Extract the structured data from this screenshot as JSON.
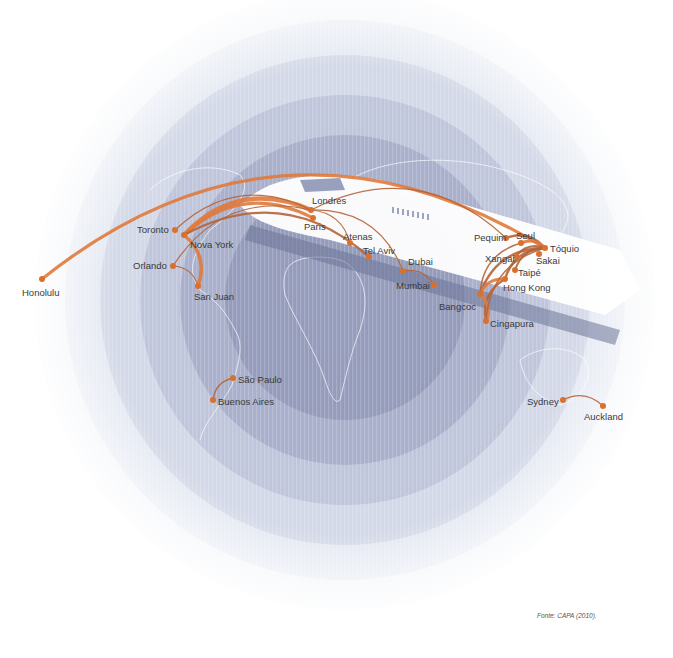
{
  "source_note": "Fonte: CAPA (2010).",
  "colors": {
    "route": "#e07a3c",
    "route_dark": "#b4643a",
    "node": "#d9702e",
    "ring_light": "#e6eaf3",
    "ring_dark": "#8a92b2",
    "plane_body": "#ffffff"
  },
  "cities": [
    {
      "id": "honolulu",
      "label": "Honolulu",
      "x": 42,
      "y": 279,
      "lx": 22,
      "ly": 296
    },
    {
      "id": "toronto",
      "label": "Toronto",
      "x": 175,
      "y": 230,
      "lx": 137,
      "ly": 233
    },
    {
      "id": "nova-york",
      "label": "Nova York",
      "x": 184,
      "y": 235,
      "lx": 190,
      "ly": 248
    },
    {
      "id": "orlando",
      "label": "Orlando",
      "x": 173,
      "y": 266,
      "lx": 133,
      "ly": 269
    },
    {
      "id": "san-juan",
      "label": "San Juan",
      "x": 198,
      "y": 286,
      "lx": 194,
      "ly": 300
    },
    {
      "id": "londres",
      "label": "Londres",
      "x": 311,
      "y": 210,
      "lx": 312,
      "ly": 204
    },
    {
      "id": "paris",
      "label": "Paris",
      "x": 313,
      "y": 218,
      "lx": 304,
      "ly": 230
    },
    {
      "id": "atenas",
      "label": "Atenas",
      "x": 350,
      "y": 243,
      "lx": 343,
      "ly": 240
    },
    {
      "id": "tel-aviv",
      "label": "Tel Aviv",
      "x": 369,
      "y": 257,
      "lx": 363,
      "ly": 254
    },
    {
      "id": "dubai",
      "label": "Dubai",
      "x": 403,
      "y": 271,
      "lx": 408,
      "ly": 265
    },
    {
      "id": "mumbai",
      "label": "Mumbai",
      "x": 434,
      "y": 285,
      "lx": 396,
      "ly": 289
    },
    {
      "id": "pequim",
      "label": "Pequim",
      "x": 506,
      "y": 238,
      "lx": 474,
      "ly": 241
    },
    {
      "id": "seul",
      "label": "Seul",
      "x": 521,
      "y": 243,
      "lx": 516,
      "ly": 239
    },
    {
      "id": "toquio",
      "label": "Tóquio",
      "x": 545,
      "y": 248,
      "lx": 550,
      "ly": 252
    },
    {
      "id": "xangai",
      "label": "Xangai",
      "x": 516,
      "y": 256,
      "lx": 485,
      "ly": 262
    },
    {
      "id": "sakai",
      "label": "Sakai",
      "x": 539,
      "y": 254,
      "lx": 536,
      "ly": 264
    },
    {
      "id": "taipe",
      "label": "Taipé",
      "x": 515,
      "y": 270,
      "lx": 518,
      "ly": 276
    },
    {
      "id": "hong-kong",
      "label": "Hong Kong",
      "x": 505,
      "y": 279,
      "lx": 503,
      "ly": 291
    },
    {
      "id": "bangcoc",
      "label": "Bangcoc",
      "x": 480,
      "y": 294,
      "lx": 439,
      "ly": 310
    },
    {
      "id": "cingapura",
      "label": "Cingapura",
      "x": 486,
      "y": 321,
      "lx": 490,
      "ly": 327
    },
    {
      "id": "sao-paulo",
      "label": "São Paulo",
      "x": 233,
      "y": 378,
      "lx": 238,
      "ly": 383
    },
    {
      "id": "buenos-aires",
      "label": "Buenos Aires",
      "x": 213,
      "y": 400,
      "lx": 218,
      "ly": 405
    },
    {
      "id": "sydney",
      "label": "Sydney",
      "x": 563,
      "y": 400,
      "lx": 527,
      "ly": 405
    },
    {
      "id": "auckland",
      "label": "Auckland",
      "x": 603,
      "y": 406,
      "lx": 584,
      "ly": 420
    }
  ],
  "routes": [
    {
      "from": "honolulu",
      "to": "toquio",
      "width": 3.2
    },
    {
      "from": "nova-york",
      "to": "londres",
      "width": 4.5
    },
    {
      "from": "nova-york",
      "to": "paris",
      "width": 3.0
    },
    {
      "from": "nova-york",
      "to": "tel-aviv",
      "width": 2.2
    },
    {
      "from": "toronto",
      "to": "londres",
      "width": 1.2
    },
    {
      "from": "orlando",
      "to": "londres",
      "width": 1.2
    },
    {
      "from": "nova-york",
      "to": "san-juan",
      "width": 3.5
    },
    {
      "from": "orlando",
      "to": "san-juan",
      "width": 1.2
    },
    {
      "from": "londres",
      "to": "atenas",
      "width": 1.2
    },
    {
      "from": "londres",
      "to": "dubai",
      "width": 1.2
    },
    {
      "from": "londres",
      "to": "pequim",
      "width": 1.2
    },
    {
      "from": "dubai",
      "to": "mumbai",
      "width": 1.2
    },
    {
      "from": "pequim",
      "to": "toquio",
      "width": 2.5
    },
    {
      "from": "seul",
      "to": "toquio",
      "width": 3.0
    },
    {
      "from": "xangai",
      "to": "toquio",
      "width": 2.0
    },
    {
      "from": "taipe",
      "to": "toquio",
      "width": 2.0
    },
    {
      "from": "hong-kong",
      "to": "toquio",
      "width": 2.5
    },
    {
      "from": "bangcoc",
      "to": "toquio",
      "width": 2.5
    },
    {
      "from": "bangcoc",
      "to": "hong-kong",
      "width": 3.0
    },
    {
      "from": "bangcoc",
      "to": "seul",
      "width": 1.5
    },
    {
      "from": "cingapura",
      "to": "hong-kong",
      "width": 2.5
    },
    {
      "from": "cingapura",
      "to": "bangcoc",
      "width": 3.5
    },
    {
      "from": "cingapura",
      "to": "toquio",
      "width": 1.5
    },
    {
      "from": "sao-paulo",
      "to": "buenos-aires",
      "width": 1.3
    },
    {
      "from": "sydney",
      "to": "auckland",
      "width": 1.3
    }
  ]
}
